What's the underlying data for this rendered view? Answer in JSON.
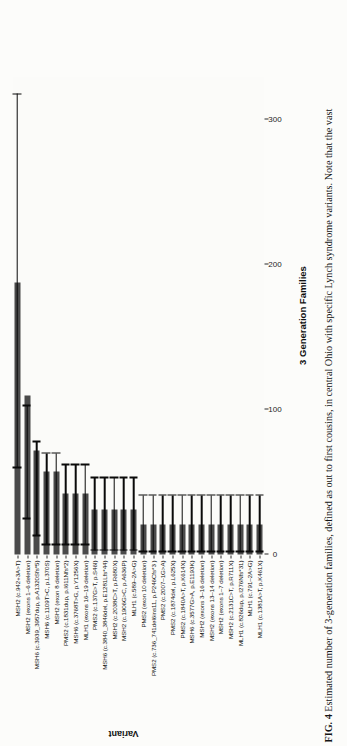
{
  "figure": {
    "label": "FIG. 4",
    "caption": "Estimated number of 3-generation families, defined as out to first cousins, in central Ohio with specific Lynch syndrome variants. Note that the vast"
  },
  "chart_data": {
    "type": "bar",
    "orientation": "horizontal",
    "title": "",
    "xlabel": "3 Generation Families",
    "ylabel": "Variant",
    "xlim": [
      0,
      330
    ],
    "xticks": [
      0,
      100,
      200,
      300
    ],
    "xtick_labels": [
      "0",
      "100",
      "200",
      "300"
    ],
    "grid": false,
    "legend": "none",
    "bar_color": "#4a4a4a",
    "error_color": "#0a0a0a",
    "categories": [
      "MSH2 (c.942+3A>T)",
      "MSH2 (exons 1–6 deletion)",
      "MSH6 (c.3939_3957dup, p.A1320Sfs*5)",
      "MSH6 (c.1109T>C, p.L370S)",
      "MSH2 (exon 8 deletion)",
      "PMS2 (c.1831dup, p.I611Nfs*2)",
      "MSH6 (c.3768T>G, p.Y1256X)",
      "MLH1 (exons 16–19 deletion)",
      "PMS2 (c.137G>T, p.S46I)",
      "MSH6 (c.3840_3846del, p.E1281Lfs*44)",
      "MSH2 (c.2038C>T, p.R680X)",
      "MSH2 (c.1906G>C, p.A636P)",
      "MLH1 (c.589–2A>G)",
      "PMS2 (exon 10 deletion)",
      "PMS2 (c.736_741del6ins11, p.P246Cfs*3 )",
      "PMS2 (c.2007–1G>A)",
      "PMS2 (c.1874del, p.L625X)",
      "PMS2 (c.1840A>T, p.K614X)",
      "MSH6 (c.3577G>A, p.E1193K)",
      "MSH2 (exons 3–16 deletion)",
      "MSH2 (exons 13–14 deletion)",
      "MSH2 (exons 1–7 deletion)",
      "MSH2 (c.2131C>T, p.R711X)",
      "MLH1 (c.826dup, p.I276Nfs*31)",
      "MLH1 (c.791–2A>G)",
      "MLH1 (c.1381A>T, p.K461X)"
    ],
    "values": [
      188,
      110,
      72,
      57,
      57,
      42,
      42,
      42,
      31,
      31,
      31,
      31,
      31,
      21,
      21,
      21,
      21,
      21,
      21,
      21,
      21,
      21,
      21,
      21,
      21,
      21
    ],
    "error_low": [
      60,
      25,
      13,
      7,
      7,
      7,
      7,
      7,
      3,
      3,
      3,
      3,
      3,
      2,
      2,
      2,
      2,
      2,
      2,
      2,
      2,
      2,
      2,
      2,
      2,
      2
    ],
    "error_high": [
      318,
      103,
      78,
      70,
      70,
      62,
      62,
      62,
      53,
      53,
      53,
      53,
      53,
      41,
      41,
      41,
      41,
      41,
      41,
      41,
      41,
      41,
      41,
      41,
      41,
      41
    ]
  }
}
